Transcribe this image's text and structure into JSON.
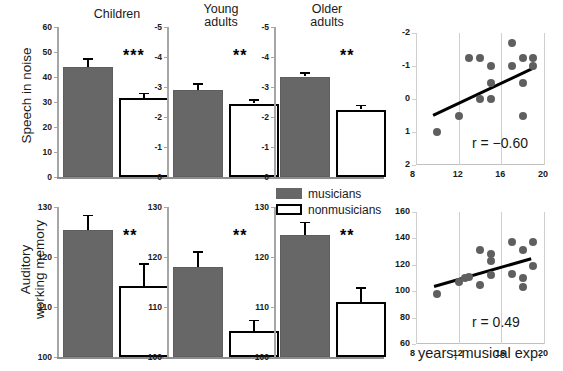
{
  "figure": {
    "row_labels": {
      "row1": "Speech in noise",
      "row2_line1": "Auditory",
      "row2_line2": "working memory"
    },
    "legend": {
      "musicians": "musicians",
      "nonmusicians": "nonmusicians"
    },
    "colors": {
      "musician_fill": "#676767",
      "nonmusician_fill": "#ffffff",
      "nonmusician_border": "#000000",
      "dot": "#5f5f5f",
      "trend_line": "#000000",
      "axis": "#a6a6a6"
    },
    "xaxis_title": "years, musical exp."
  },
  "chart_data": [
    {
      "type": "bar",
      "id": "speech-children",
      "title": "Children",
      "ylabel": "Speech in noise",
      "ylim": [
        0,
        60
      ],
      "yticks": [
        0,
        10,
        20,
        30,
        40,
        50,
        60
      ],
      "ytick_labels": [
        "0",
        "10",
        "20",
        "30",
        "40",
        "50",
        "60"
      ],
      "inverted": false,
      "categories": [
        "musicians",
        "nonmusicians"
      ],
      "values": [
        44.0,
        31.5
      ],
      "errors": [
        3.6,
        2.2
      ],
      "significance": "***"
    },
    {
      "type": "bar",
      "id": "speech-young-adults",
      "title": "Young adults",
      "ylabel": "Speech in noise",
      "ylim": [
        -5,
        0
      ],
      "yticks": [
        0,
        -1,
        -2,
        -3,
        -4,
        -5
      ],
      "ytick_labels": [
        "0",
        "-1",
        "-2",
        "-3",
        "-4",
        "-5"
      ],
      "inverted": true,
      "categories": [
        "musicians",
        "nonmusicians"
      ],
      "values": [
        -2.9,
        -2.45
      ],
      "errors": [
        0.22,
        0.14
      ],
      "significance": "**"
    },
    {
      "type": "bar",
      "id": "speech-older-adults",
      "title": "Older adults",
      "ylabel": "Speech in noise",
      "ylim": [
        -5,
        0
      ],
      "yticks": [
        0,
        -1,
        -2,
        -3,
        -4,
        -5
      ],
      "ytick_labels": [
        "0",
        "-1",
        "-2",
        "-3",
        "-4",
        "-5"
      ],
      "inverted": true,
      "categories": [
        "musicians",
        "nonmusicians"
      ],
      "values": [
        -3.35,
        -2.25
      ],
      "errors": [
        0.14,
        0.16
      ],
      "significance": "**"
    },
    {
      "type": "scatter",
      "id": "speech-correlation",
      "xlabel": "years, musical exp.",
      "ylabel": "Speech in noise",
      "xlim": [
        8,
        20
      ],
      "ylim": [
        -2,
        2
      ],
      "xticks": [
        8,
        12,
        16,
        20
      ],
      "xtick_labels": [
        "8",
        "12",
        "16",
        "20"
      ],
      "yticks": [
        -2,
        -1,
        0,
        1,
        2
      ],
      "ytick_labels": [
        "-2",
        "-1",
        "0",
        "1",
        "2"
      ],
      "y_inverted": true,
      "annotation": "r = −0.60",
      "r": -0.6,
      "points": [
        [
          10.0,
          1.0
        ],
        [
          12.0,
          0.5
        ],
        [
          13.0,
          -1.25
        ],
        [
          14.0,
          -1.25
        ],
        [
          15.0,
          -1.0
        ],
        [
          15.0,
          -0.5
        ],
        [
          15.0,
          0.0
        ],
        [
          14.0,
          0.0
        ],
        [
          17.0,
          -1.7
        ],
        [
          17.0,
          -1.0
        ],
        [
          18.0,
          -1.25
        ],
        [
          18.0,
          -0.5
        ],
        [
          18.0,
          0.5
        ],
        [
          19.0,
          -1.25
        ],
        [
          19.0,
          -1.0
        ]
      ],
      "trend": {
        "x1": 9.6,
        "y1": 0.45,
        "x2": 19.1,
        "y2": -1.0
      }
    },
    {
      "type": "bar",
      "id": "memory-children",
      "title": "Children",
      "ylabel": "Auditory working memory",
      "ylim": [
        100,
        130
      ],
      "yticks": [
        100,
        110,
        120,
        130
      ],
      "ytick_labels": [
        "100",
        "110",
        "120",
        "130"
      ],
      "inverted": false,
      "categories": [
        "musicians",
        "nonmusicians"
      ],
      "values": [
        125.5,
        114.3
      ],
      "errors": [
        3.0,
        4.5
      ],
      "significance": "**"
    },
    {
      "type": "bar",
      "id": "memory-young-adults",
      "title": "Young adults",
      "ylabel": "Auditory working memory",
      "ylim": [
        100,
        130
      ],
      "yticks": [
        100,
        110,
        120,
        130
      ],
      "ytick_labels": [
        "100",
        "110",
        "120",
        "130"
      ],
      "inverted": false,
      "categories": [
        "musicians",
        "nonmusicians"
      ],
      "values": [
        118.0,
        105.3
      ],
      "errors": [
        3.2,
        2.2
      ],
      "significance": "**"
    },
    {
      "type": "bar",
      "id": "memory-older-adults",
      "title": "Older adults",
      "ylabel": "Auditory working memory",
      "ylim": [
        100,
        130
      ],
      "yticks": [
        100,
        110,
        120,
        130
      ],
      "ytick_labels": [
        "100",
        "110",
        "120",
        "130"
      ],
      "inverted": false,
      "categories": [
        "musicians",
        "nonmusicians"
      ],
      "values": [
        124.5,
        111.0
      ],
      "errors": [
        2.6,
        3.0
      ],
      "significance": "**"
    },
    {
      "type": "scatter",
      "id": "memory-correlation",
      "xlabel": "years, musical exp.",
      "ylabel": "Auditory working memory",
      "xlim": [
        8,
        20
      ],
      "ylim": [
        60,
        160
      ],
      "xticks": [
        8,
        12,
        16,
        20
      ],
      "xtick_labels": [
        "8",
        "12",
        "16",
        "20"
      ],
      "yticks": [
        60,
        80,
        100,
        120,
        140,
        160
      ],
      "ytick_labels": [
        "60",
        "80",
        "100",
        "120",
        "140",
        "160"
      ],
      "y_inverted": false,
      "annotation": "r = 0.49",
      "r": 0.49,
      "points": [
        [
          10.0,
          98.0
        ],
        [
          12.0,
          107.0
        ],
        [
          12.6,
          110.0
        ],
        [
          13.0,
          110.5
        ],
        [
          14.0,
          131.0
        ],
        [
          14.0,
          105.0
        ],
        [
          15.0,
          128.0
        ],
        [
          15.0,
          123.0
        ],
        [
          15.0,
          112.0
        ],
        [
          17.0,
          137.0
        ],
        [
          17.0,
          113.0
        ],
        [
          18.0,
          131.0
        ],
        [
          18.0,
          110.0
        ],
        [
          18.0,
          103.0
        ],
        [
          19.0,
          137.0
        ],
        [
          19.0,
          119.0
        ]
      ],
      "trend": {
        "x1": 9.7,
        "y1": 104.5,
        "x2": 18.8,
        "y2": 125.5
      }
    }
  ]
}
